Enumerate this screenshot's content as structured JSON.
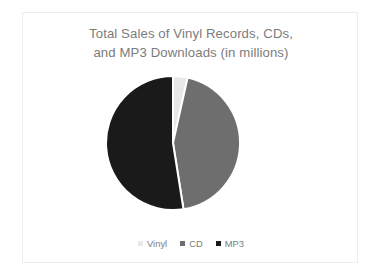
{
  "slide": {
    "background_color": "#ffffff",
    "border_color": "#ededed"
  },
  "chart": {
    "title": "Total Sales of Vinyl Records, CDs,\nand MP3 Downloads (in millions)",
    "title_color": "#7c7c7c",
    "legend_text_color": "#7c7c7c"
  },
  "legend": {
    "items": [
      {
        "label": "Vinyl",
        "color": "#e8e8e8"
      },
      {
        "label": "CD",
        "color": "#6e6e6e"
      },
      {
        "label": "MP3",
        "color": "#1a1a1a"
      }
    ]
  },
  "chart_data": {
    "type": "pie",
    "title": "Total Sales of Vinyl Records, CDs, and MP3 Downloads (in millions)",
    "xlabel": "",
    "ylabel": "",
    "legend_position": "bottom",
    "grid": false,
    "start_angle_deg": 0,
    "direction": "clockwise",
    "categories": [
      "Vinyl",
      "CD",
      "MP3"
    ],
    "values": [
      3.5,
      44,
      52.5
    ],
    "colors": [
      "#e8e8e8",
      "#6e6e6e",
      "#1a1a1a"
    ],
    "slice_separator_color": "#ffffff"
  }
}
